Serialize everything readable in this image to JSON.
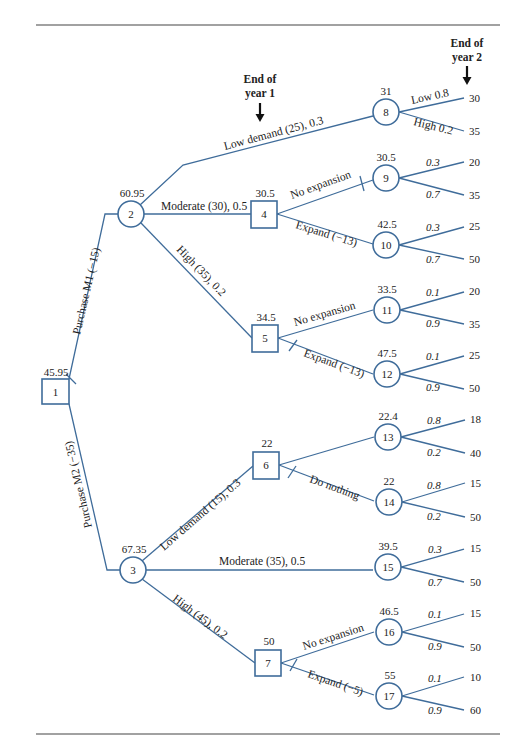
{
  "header": {
    "end_year1": [
      "End of",
      "year 1"
    ],
    "end_year2": [
      "End of",
      "year 2"
    ]
  },
  "colors": {
    "line": "#3f6c9a",
    "text": "#222222"
  },
  "nodes": [
    {
      "id": "1",
      "type": "decision",
      "value": "45.95"
    },
    {
      "id": "2",
      "type": "chance",
      "value": "60.95"
    },
    {
      "id": "3",
      "type": "chance",
      "value": "67.35"
    },
    {
      "id": "4",
      "type": "decision",
      "value": "30.5"
    },
    {
      "id": "5",
      "type": "decision",
      "value": "34.5"
    },
    {
      "id": "6",
      "type": "decision",
      "value": "22"
    },
    {
      "id": "7",
      "type": "decision",
      "value": "50"
    },
    {
      "id": "8",
      "type": "chance",
      "value": "31"
    },
    {
      "id": "9",
      "type": "chance",
      "value": "30.5"
    },
    {
      "id": "10",
      "type": "chance",
      "value": "42.5"
    },
    {
      "id": "11",
      "type": "chance",
      "value": "33.5"
    },
    {
      "id": "12",
      "type": "chance",
      "value": "47.5"
    },
    {
      "id": "13",
      "type": "chance",
      "value": "22.4"
    },
    {
      "id": "14",
      "type": "chance",
      "value": "22"
    },
    {
      "id": "15",
      "type": "chance",
      "value": "39.5"
    },
    {
      "id": "16",
      "type": "chance",
      "value": "46.5"
    },
    {
      "id": "17",
      "type": "chance",
      "value": "55"
    }
  ],
  "edges": {
    "purchase_m1": "Purchase M1 (−15)",
    "purchase_m2": "Purchase M2 (−35)",
    "n2_low": "Low demand (25), 0.3",
    "n2_mod": "Moderate (30), 0.5",
    "n2_high": "High (35), 0.2",
    "n4_noexp": "No expansion",
    "n4_exp": "Expand (−13)",
    "n5_noexp": "No expansion",
    "n5_exp": "Expand (−13)",
    "n3_low": "Low demand (15), 0.3",
    "n3_mod": "Moderate (35), 0.5",
    "n3_high": "High (45), 0.2",
    "n6_cut": "Cut back (−5)",
    "n6_nothing": "Do nothing",
    "n7_noexp": "No expansion",
    "n7_exp": "Expand (−5)"
  },
  "leaves": [
    {
      "from": "8",
      "upper": {
        "prob": "Low 0.8",
        "payoff": "30"
      },
      "lower": {
        "prob": "High 0.2",
        "payoff": "35"
      }
    },
    {
      "from": "9",
      "upper": {
        "prob": "0.3",
        "payoff": "20"
      },
      "lower": {
        "prob": "0.7",
        "payoff": "35"
      }
    },
    {
      "from": "10",
      "upper": {
        "prob": "0.3",
        "payoff": "25"
      },
      "lower": {
        "prob": "0.7",
        "payoff": "50"
      }
    },
    {
      "from": "11",
      "upper": {
        "prob": "0.1",
        "payoff": "20"
      },
      "lower": {
        "prob": "0.9",
        "payoff": "35"
      }
    },
    {
      "from": "12",
      "upper": {
        "prob": "0.1",
        "payoff": "25"
      },
      "lower": {
        "prob": "0.9",
        "payoff": "50"
      }
    },
    {
      "from": "13",
      "upper": {
        "prob": "0.8",
        "payoff": "18"
      },
      "lower": {
        "prob": "0.2",
        "payoff": "40"
      }
    },
    {
      "from": "14",
      "upper": {
        "prob": "0.8",
        "payoff": "15"
      },
      "lower": {
        "prob": "0.2",
        "payoff": "50"
      }
    },
    {
      "from": "15",
      "upper": {
        "prob": "0.3",
        "payoff": "15"
      },
      "lower": {
        "prob": "0.7",
        "payoff": "50"
      }
    },
    {
      "from": "16",
      "upper": {
        "prob": "0.1",
        "payoff": "15"
      },
      "lower": {
        "prob": "0.9",
        "payoff": "50"
      }
    },
    {
      "from": "17",
      "upper": {
        "prob": "0.1",
        "payoff": "10"
      },
      "lower": {
        "prob": "0.9",
        "payoff": "60"
      }
    }
  ]
}
